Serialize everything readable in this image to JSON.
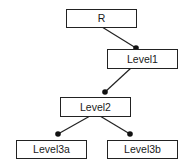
{
  "diagram": {
    "type": "tree",
    "colors": {
      "stroke": "#222222",
      "fill": "#ffffff",
      "text": "#1a1a1a",
      "dot": "#111111"
    },
    "nodes": [
      {
        "id": "R",
        "label": "R",
        "x": 66,
        "y": 9,
        "w": 70,
        "h": 18
      },
      {
        "id": "Level1",
        "label": "Level1",
        "x": 107,
        "y": 49,
        "w": 70,
        "h": 19
      },
      {
        "id": "Level2",
        "label": "Level2",
        "x": 60,
        "y": 97,
        "w": 70,
        "h": 19
      },
      {
        "id": "Level3a",
        "label": "Level3a",
        "x": 16,
        "y": 140,
        "w": 70,
        "h": 18
      },
      {
        "id": "Level3b",
        "label": "Level3b",
        "x": 107,
        "y": 140,
        "w": 70,
        "h": 18
      }
    ],
    "edges": [
      {
        "from": "R",
        "to": "Level1",
        "x1": 102,
        "y1": 27,
        "x2": 136,
        "y2": 48
      },
      {
        "from": "Level1",
        "to": "Level2",
        "x1": 131,
        "y1": 68,
        "x2": 105,
        "y2": 92
      },
      {
        "from": "Level2",
        "to": "Level3a",
        "x1": 90,
        "y1": 116,
        "x2": 58,
        "y2": 134
      },
      {
        "from": "Level2",
        "to": "Level3b",
        "x1": 100,
        "y1": 116,
        "x2": 130,
        "y2": 134
      }
    ]
  }
}
